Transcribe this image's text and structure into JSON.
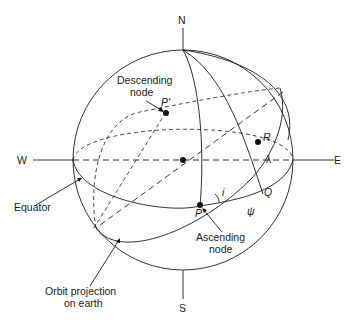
{
  "diagram": {
    "type": "celestial-sphere orbit geometry",
    "compass": {
      "north": "N",
      "south": "S",
      "east": "E",
      "west": "W"
    },
    "points": {
      "ascending_node": "P",
      "descending_node": "P'",
      "satellite_point": "R",
      "equator_point": "Q"
    },
    "angles": {
      "inclination": "i",
      "longitude": "λ",
      "arc": "ψ"
    },
    "labels": {
      "descending_line1": "Descending",
      "descending_line2": "node",
      "ascending_line1": "Ascending",
      "ascending_line2": "node",
      "equator": "Equator",
      "orbit_line1": "Orbit projection",
      "orbit_line2": "on earth"
    },
    "colors": {
      "ink": "#1a1a1a",
      "background": "#ffffff"
    }
  }
}
